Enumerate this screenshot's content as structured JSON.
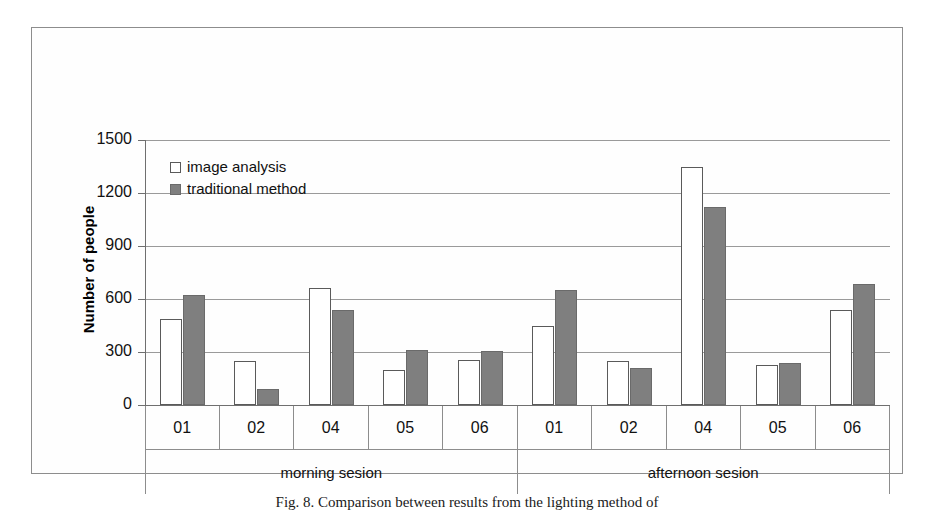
{
  "figure": {
    "caption": "Fig. 8. Comparison between results from the lighting method of",
    "frame_color": "#8d8d8d"
  },
  "legend": {
    "position": "inside-top-left",
    "entries": [
      {
        "label": "image analysis",
        "swatch": "light",
        "color": "#ffffff"
      },
      {
        "label": "traditional method",
        "swatch": "dark",
        "color": "#7f7f7f"
      }
    ]
  },
  "chart_data": {
    "type": "bar",
    "title": "",
    "xlabel": "",
    "ylabel": "Number of people",
    "ylim": [
      0,
      1500
    ],
    "yticks": [
      0,
      300,
      600,
      900,
      1200,
      1500
    ],
    "ytick_labels": [
      "0",
      "300",
      "600",
      "900",
      "1200",
      "1500"
    ],
    "grid": true,
    "grouping": "grouped",
    "groups": [
      {
        "name": "morning sesion",
        "categories": [
          "01",
          "02",
          "04",
          "05",
          "06"
        ]
      },
      {
        "name": "afternoon sesion",
        "categories": [
          "01",
          "02",
          "04",
          "05",
          "06"
        ]
      }
    ],
    "categories": [
      "01",
      "02",
      "04",
      "05",
      "06",
      "01",
      "02",
      "04",
      "05",
      "06"
    ],
    "series": [
      {
        "name": "image analysis",
        "color": "#ffffff",
        "values": [
          485,
          250,
          665,
          200,
          255,
          450,
          250,
          1350,
          225,
          535
        ]
      },
      {
        "name": "traditional method",
        "color": "#7f7f7f",
        "values": [
          620,
          90,
          540,
          312,
          305,
          650,
          210,
          1120,
          235,
          685
        ]
      }
    ]
  }
}
